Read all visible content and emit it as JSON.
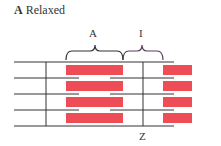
{
  "figure": {
    "panel_letter": "A",
    "panel_title": "Relaxed",
    "labels": {
      "a_band": "A",
      "i_band": "I",
      "z_line": "Z"
    },
    "colors": {
      "thick_filament": "#ee4d55",
      "line": "#333333",
      "brace": "#333333",
      "i_brace": "#5a3d5e"
    }
  }
}
